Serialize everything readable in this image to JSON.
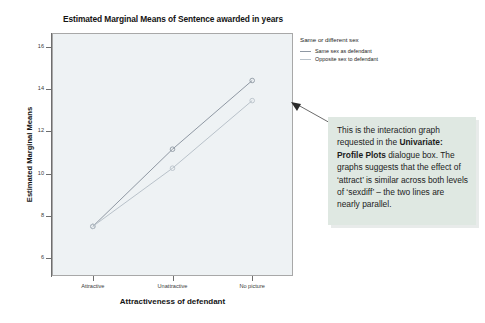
{
  "chart_data": {
    "type": "line",
    "title": "Estimated Marginal Means of Sentence awarded in years",
    "xlabel": "Attractiveness of defendant",
    "ylabel": "Estimated Marginal Means",
    "categories": [
      "Attractive",
      "Unattractive",
      "No picture"
    ],
    "yticks": [
      6,
      8,
      10,
      12,
      14,
      16
    ],
    "ylim": [
      5.2,
      16.6
    ],
    "grid": false,
    "legend_position": "right",
    "legend_title": "Same or different sex",
    "series": [
      {
        "name": "Same sex as defendant",
        "values": [
          7.5,
          11.15,
          14.4
        ],
        "color": "#8f98a3",
        "marker": "circle"
      },
      {
        "name": "Opposite sex to defendant",
        "values": [
          7.5,
          10.25,
          13.45
        ],
        "color": "#b9c2ca",
        "marker": "circle"
      }
    ]
  },
  "chart": {
    "title": "Estimated Marginal Means of Sentence awarded in years",
    "x_axis_title": "Attractiveness of defendant",
    "y_axis_title": "Estimated Marginal Means",
    "x_tick_labels": [
      "Attractive",
      "Unattractive",
      "No picture"
    ],
    "y_tick_labels": [
      "6",
      "8",
      "10",
      "12",
      "14",
      "16"
    ],
    "plot_background": "#eef2f4",
    "plot_border": "#a8a8a8"
  },
  "legend": {
    "title": "Same or different sex",
    "items": [
      {
        "label": "Same sex as defendant",
        "color": "#8f98a3"
      },
      {
        "label": "Opposite sex to defendant",
        "color": "#b9c2ca"
      }
    ]
  },
  "callout": {
    "background": "#dfe8e2",
    "line1": "This is the interaction graph",
    "line2_pre": "requested in the ",
    "line2_bold": "Univariate:",
    "line3_bold": "Profile Plots",
    "line3_post": " dialogue box.",
    "line4": "The graphs suggests that",
    "line5": "the effect of ‘attract’ is",
    "line6": "similar across both levels of",
    "line7": "‘sexdiff’ – the two lines are",
    "line8": "nearly parallel."
  }
}
